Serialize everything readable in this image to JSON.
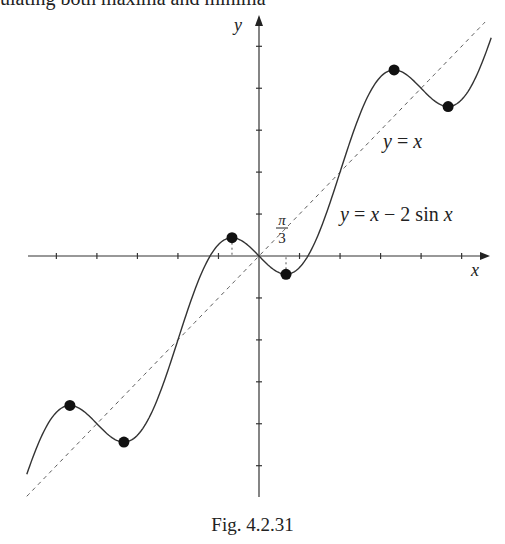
{
  "top_text": "ulating both maxima and minima",
  "caption": "Fig.  4.2.31",
  "chart_data": {
    "type": "line",
    "title": "",
    "xlabel": "x",
    "ylabel": "y",
    "x_range": [
      -9,
      9
    ],
    "y_range": [
      -9,
      9
    ],
    "x_tick_step": "π/2",
    "y_tick_step": "π/2",
    "x_ticks": [
      -7.854,
      -6.283,
      -4.712,
      -3.142,
      -1.571,
      1.571,
      3.142,
      4.712,
      6.283,
      7.854
    ],
    "y_ticks": [
      -7.854,
      -6.283,
      -4.712,
      -3.142,
      -1.571,
      1.571,
      3.142,
      4.712,
      6.283,
      7.854
    ],
    "grid": false,
    "series": [
      {
        "name": "y = x − 2 sin x",
        "style": "solid",
        "function": "x - 2*sin(x)",
        "domain": [
          -9,
          9
        ]
      },
      {
        "name": "y = x",
        "style": "dashed",
        "function": "x",
        "domain": [
          -9,
          8.76
        ]
      }
    ],
    "extrema_points": [
      {
        "x": -7.33,
        "y": -5.598,
        "kind": "local max",
        "label": "-7π/3"
      },
      {
        "x": -5.236,
        "y": -6.968,
        "kind": "local min",
        "label": "-5π/3"
      },
      {
        "x": -1.047,
        "y": 0.685,
        "kind": "local max",
        "label": "-π/3"
      },
      {
        "x": 1.047,
        "y": -0.685,
        "kind": "local min",
        "label": "π/3"
      },
      {
        "x": 5.236,
        "y": 6.968,
        "kind": "local max",
        "label": "5π/3"
      },
      {
        "x": 7.33,
        "y": 5.598,
        "kind": "local min",
        "label": "7π/3"
      }
    ],
    "annotations": [
      {
        "text": "y = x",
        "near": "dashed line, upper right"
      },
      {
        "text": "y = x − 2 sin x",
        "near": "curve, right of origin"
      },
      {
        "text": "π/3",
        "near": "x-axis, right of origin"
      }
    ]
  },
  "labels": {
    "x_axis": "x",
    "y_axis": "y",
    "line_label": "y = x",
    "curve_label": "y = x − 2 sin x",
    "pi_num": "π",
    "pi_den": "3"
  }
}
